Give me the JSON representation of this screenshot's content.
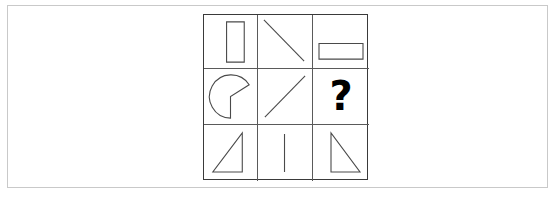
{
  "puzzle": {
    "type": "matrix-reasoning",
    "rows": 3,
    "columns": 3,
    "grid_border_color": "#3a3a3a",
    "cell_line_color": "#5a5a5a",
    "shape_stroke_color": "#4a4a4a",
    "outer_frame_color": "#c9c9c9",
    "background_color": "#ffffff",
    "missing_cell": {
      "row": 2,
      "column": 3,
      "label": "?"
    },
    "cells": [
      {
        "id": "cell-r1c1",
        "row": 1,
        "column": 3,
        "shape": "vertical-rectangle",
        "description": "tall narrow vertical rectangle outline, right of center"
      },
      {
        "id": "cell-r1c2",
        "row": 1,
        "column": 2,
        "shape": "diagonal-line-backslash",
        "description": "diagonal line from upper-left to lower-right"
      },
      {
        "id": "cell-r1c3",
        "row": 1,
        "column": 3,
        "shape": "horizontal-rectangle",
        "description": "wide short horizontal rectangle outline, lower portion"
      },
      {
        "id": "cell-r2c1",
        "row": 2,
        "column": 1,
        "shape": "pacman-circle",
        "description": "circle with wedge notch cut from the right side"
      },
      {
        "id": "cell-r2c2",
        "row": 2,
        "column": 2,
        "shape": "diagonal-line-slash",
        "description": "diagonal line from lower-left to upper-right"
      },
      {
        "id": "cell-r2c3",
        "row": 2,
        "column": 3,
        "shape": "question-mark",
        "description": "bold question mark marking the missing element"
      },
      {
        "id": "cell-r3c1",
        "row": 3,
        "column": 1,
        "shape": "right-triangle-vertical-right",
        "description": "right triangle, vertical edge on right, hypotenuse rising left to right"
      },
      {
        "id": "cell-r3c2",
        "row": 3,
        "column": 2,
        "shape": "vertical-line",
        "description": "single centered vertical line segment"
      },
      {
        "id": "cell-r3c3",
        "row": 3,
        "column": 3,
        "shape": "right-triangle-vertical-left",
        "description": "right triangle, vertical edge on left, hypotenuse falling left to right"
      }
    ]
  }
}
